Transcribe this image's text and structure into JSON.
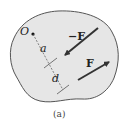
{
  "figure": {
    "caption": "(a)",
    "body_fill": "#e6e6e6",
    "body_stroke": "#555555",
    "arrow_color": "#333333"
  },
  "labels": {
    "origin": "O",
    "distance_a": "a",
    "distance_d": "d",
    "force_neg": "−F",
    "force_pos": "F"
  }
}
